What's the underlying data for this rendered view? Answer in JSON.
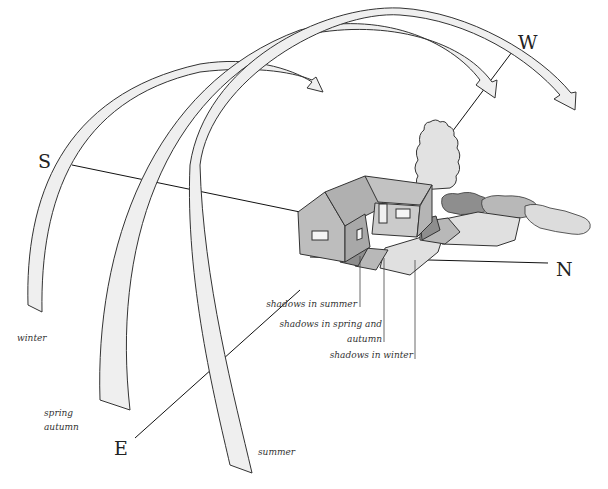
{
  "diagram": {
    "type": "sun-path-diagram",
    "directions": {
      "south": "S",
      "west": "W",
      "north": "N",
      "east": "E"
    },
    "sun_paths": [
      {
        "season": "winter",
        "label": "winter"
      },
      {
        "season": "spring_autumn",
        "label_line1": "spring",
        "label_line2": "autumn"
      },
      {
        "season": "summer",
        "label": "summer"
      }
    ],
    "shadow_labels": {
      "summer": "shadows in summer",
      "spring_autumn_line1": "shadows in spring and",
      "spring_autumn_line2": "autumn",
      "winter": "shadows in winter"
    },
    "colors": {
      "arc_fill": "#efefef",
      "house_wall_light": "#c8c8c8",
      "house_wall_dark": "#a9a9a9",
      "roof": "#b5b5b5",
      "shadow_summer": "#8e8e8e",
      "shadow_spring": "#b8b8b8",
      "shadow_winter": "#dedede",
      "tree": "#e2e2e2"
    }
  }
}
